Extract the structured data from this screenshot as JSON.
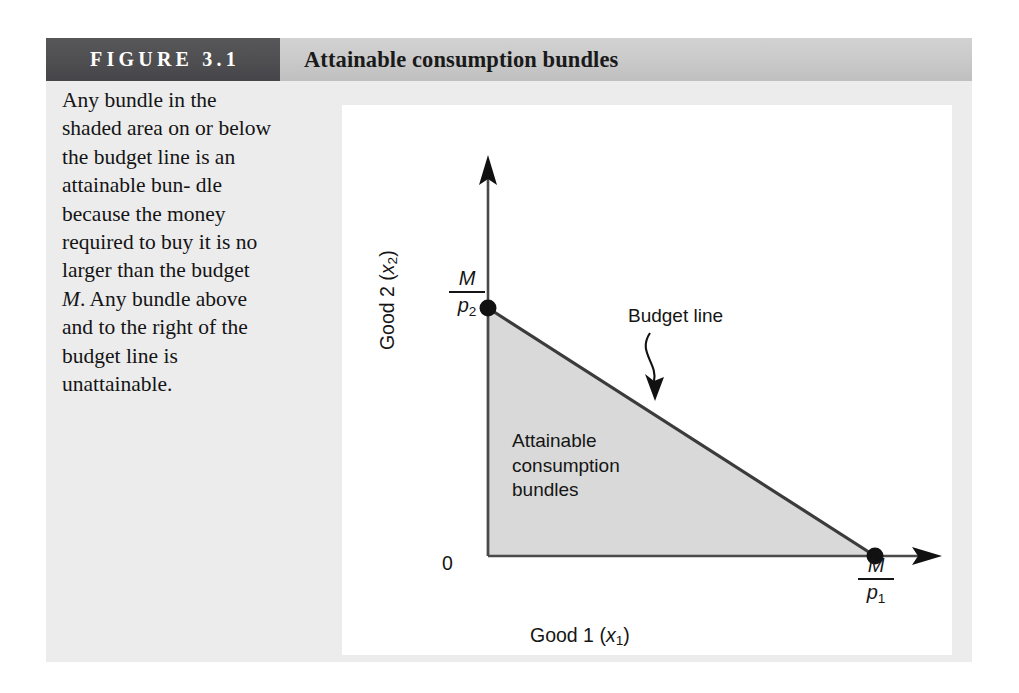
{
  "figure": {
    "number_label": "FIGURE 3.1",
    "title": "Attainable consumption bundles",
    "caption_lines": [
      "Any bundle in the",
      "shaded area on or",
      "below the budget line",
      "is an attainable bun-",
      "dle because the",
      "money required to",
      "buy it is no larger",
      "than the budget M.",
      "Any bundle above",
      "and to the right of",
      "the budget line is",
      "unattainable."
    ],
    "caption_italic_token": "M"
  },
  "diagram": {
    "type": "budget-constraint",
    "x_axis_label": "Good 1 (x₁)",
    "x_axis_label_parts": {
      "prefix": "Good 1 (",
      "var": "x",
      "sub": "1",
      "suffix": ")"
    },
    "y_axis_label": "Good 2 (x₂)",
    "y_axis_label_parts": {
      "prefix": "Good 2 (",
      "var": "x",
      "sub": "2",
      "suffix": ")"
    },
    "origin_label": "0",
    "y_intercept_label": {
      "numerator": "M",
      "denominator": "p",
      "denominator_sub": "2"
    },
    "x_intercept_label": {
      "numerator": "M",
      "denominator": "p",
      "denominator_sub": "1"
    },
    "budget_line_annotation": "Budget line",
    "region_label_lines": [
      "Attainable",
      "consumption",
      "bundles"
    ],
    "shaded_region_fill": "#d9d9d9",
    "line_color": "#3a3a3a",
    "axis_color": "#4a4a4a",
    "points": [
      {
        "name": "y-intercept",
        "x": 146,
        "y": 203
      },
      {
        "name": "x-intercept",
        "x": 533,
        "y": 451
      },
      {
        "name": "origin",
        "x": 146,
        "y": 451
      }
    ],
    "panel_background": "#ffffff",
    "card_background": "#ececed",
    "header_dark": "#4e4e51",
    "header_light": "#c9c9ca"
  }
}
